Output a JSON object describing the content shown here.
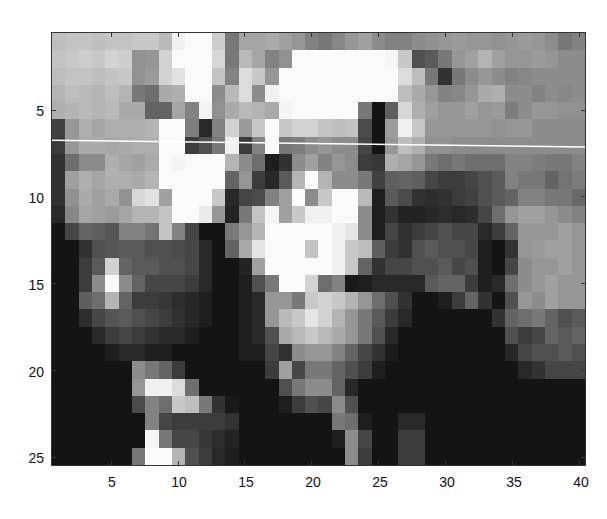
{
  "chart_data": {
    "type": "heatmap",
    "title": "",
    "xlabel": "",
    "ylabel": "",
    "colormap": "gray",
    "cols": 40,
    "rows": 25,
    "xlim": [
      0.5,
      40.5
    ],
    "ylim": [
      0.5,
      25.5
    ],
    "y_reversed": true,
    "xticks": [
      5,
      10,
      15,
      20,
      25,
      30,
      35,
      40
    ],
    "yticks": [
      5,
      10,
      15,
      20,
      25
    ],
    "xtick_labels": [
      "5",
      "10",
      "15",
      "20",
      "25",
      "30",
      "35",
      "40"
    ],
    "ytick_labels": [
      "5",
      "10",
      "15",
      "20",
      "25"
    ],
    "grid": false,
    "annotation_line": {
      "color": "#ffffff",
      "x0": 0.5,
      "y0": 6.7,
      "x1": 40.5,
      "y1": 7.1
    },
    "values": [
      [
        190,
        195,
        195,
        190,
        195,
        195,
        200,
        200,
        185,
        240,
        250,
        250,
        205,
        120,
        165,
        165,
        170,
        160,
        150,
        130,
        120,
        135,
        150,
        160,
        140,
        130,
        130,
        140,
        145,
        150,
        155,
        150,
        150,
        145,
        150,
        155,
        150,
        140,
        120,
        130
      ],
      [
        195,
        200,
        205,
        200,
        210,
        205,
        145,
        150,
        210,
        250,
        250,
        250,
        215,
        120,
        185,
        165,
        130,
        145,
        250,
        250,
        250,
        250,
        250,
        250,
        250,
        245,
        200,
        80,
        90,
        120,
        150,
        160,
        180,
        160,
        150,
        150,
        155,
        150,
        140,
        140
      ],
      [
        190,
        195,
        195,
        190,
        195,
        200,
        145,
        155,
        210,
        225,
        250,
        250,
        195,
        130,
        220,
        200,
        150,
        250,
        250,
        250,
        250,
        250,
        250,
        250,
        250,
        250,
        220,
        190,
        120,
        50,
        120,
        140,
        150,
        140,
        130,
        135,
        140,
        140,
        140,
        140
      ],
      [
        180,
        190,
        185,
        180,
        190,
        180,
        120,
        110,
        170,
        175,
        250,
        250,
        140,
        185,
        220,
        140,
        240,
        250,
        250,
        250,
        250,
        250,
        250,
        250,
        250,
        250,
        190,
        170,
        150,
        130,
        135,
        150,
        170,
        175,
        140,
        140,
        130,
        140,
        135,
        140
      ],
      [
        175,
        180,
        185,
        180,
        185,
        170,
        170,
        100,
        100,
        165,
        130,
        245,
        145,
        170,
        185,
        180,
        170,
        245,
        250,
        250,
        250,
        250,
        250,
        120,
        20,
        95,
        215,
        175,
        160,
        150,
        150,
        160,
        150,
        155,
        125,
        140,
        150,
        150,
        145,
        145
      ],
      [
        65,
        150,
        175,
        165,
        175,
        175,
        175,
        180,
        250,
        250,
        125,
        40,
        130,
        210,
        155,
        200,
        250,
        200,
        210,
        210,
        195,
        190,
        195,
        75,
        20,
        155,
        240,
        200,
        150,
        150,
        150,
        150,
        150,
        145,
        150,
        150,
        140,
        140,
        140,
        140
      ],
      [
        60,
        150,
        170,
        170,
        165,
        170,
        175,
        175,
        250,
        250,
        60,
        80,
        120,
        240,
        60,
        130,
        250,
        120,
        125,
        140,
        150,
        140,
        140,
        70,
        20,
        150,
        190,
        175,
        145,
        145,
        140,
        140,
        140,
        140,
        140,
        140,
        140,
        140,
        140,
        140
      ],
      [
        50,
        110,
        140,
        140,
        175,
        165,
        160,
        170,
        250,
        245,
        250,
        250,
        250,
        180,
        140,
        110,
        30,
        50,
        140,
        160,
        130,
        150,
        140,
        60,
        55,
        175,
        165,
        150,
        120,
        110,
        120,
        110,
        110,
        110,
        130,
        130,
        125,
        120,
        120,
        130
      ],
      [
        50,
        160,
        175,
        165,
        175,
        175,
        170,
        180,
        250,
        250,
        250,
        250,
        250,
        100,
        150,
        60,
        40,
        90,
        180,
        250,
        180,
        140,
        140,
        120,
        65,
        95,
        100,
        95,
        70,
        60,
        60,
        70,
        80,
        90,
        130,
        120,
        120,
        100,
        115,
        125
      ],
      [
        50,
        145,
        170,
        160,
        170,
        145,
        215,
        225,
        160,
        250,
        250,
        250,
        200,
        40,
        70,
        75,
        130,
        160,
        250,
        140,
        200,
        250,
        250,
        185,
        30,
        90,
        75,
        50,
        45,
        50,
        60,
        65,
        80,
        90,
        100,
        130,
        130,
        120,
        120,
        105
      ],
      [
        40,
        135,
        165,
        160,
        155,
        165,
        180,
        180,
        195,
        250,
        250,
        235,
        150,
        35,
        120,
        195,
        245,
        160,
        200,
        240,
        240,
        250,
        250,
        140,
        30,
        50,
        35,
        35,
        40,
        45,
        40,
        45,
        70,
        110,
        150,
        160,
        160,
        150,
        140,
        130
      ],
      [
        20,
        70,
        100,
        95,
        85,
        130,
        130,
        115,
        195,
        130,
        70,
        20,
        20,
        120,
        150,
        180,
        250,
        250,
        250,
        250,
        250,
        240,
        230,
        140,
        30,
        70,
        50,
        60,
        70,
        80,
        70,
        70,
        40,
        60,
        100,
        150,
        150,
        150,
        160,
        150
      ],
      [
        20,
        20,
        50,
        80,
        85,
        90,
        90,
        80,
        80,
        75,
        70,
        40,
        20,
        100,
        170,
        230,
        250,
        250,
        250,
        195,
        250,
        240,
        200,
        190,
        95,
        60,
        50,
        80,
        90,
        80,
        80,
        70,
        30,
        20,
        50,
        150,
        155,
        160,
        160,
        150
      ],
      [
        20,
        20,
        60,
        90,
        210,
        100,
        90,
        90,
        80,
        80,
        70,
        40,
        20,
        20,
        35,
        160,
        250,
        250,
        250,
        250,
        250,
        240,
        200,
        100,
        50,
        70,
        70,
        80,
        80,
        90,
        70,
        80,
        30,
        20,
        70,
        140,
        150,
        150,
        160,
        150
      ],
      [
        20,
        20,
        60,
        140,
        250,
        140,
        100,
        70,
        70,
        70,
        60,
        40,
        20,
        20,
        30,
        80,
        120,
        250,
        250,
        210,
        110,
        130,
        25,
        30,
        40,
        40,
        40,
        40,
        90,
        100,
        100,
        60,
        30,
        40,
        110,
        140,
        150,
        160,
        150,
        150
      ],
      [
        20,
        20,
        95,
        110,
        180,
        100,
        60,
        60,
        55,
        45,
        40,
        30,
        20,
        20,
        30,
        40,
        150,
        150,
        120,
        200,
        210,
        200,
        180,
        150,
        110,
        80,
        50,
        20,
        20,
        30,
        60,
        100,
        50,
        20,
        80,
        150,
        140,
        160,
        150,
        150
      ],
      [
        20,
        20,
        45,
        70,
        85,
        90,
        80,
        70,
        60,
        50,
        40,
        30,
        20,
        20,
        30,
        40,
        150,
        185,
        200,
        230,
        210,
        180,
        150,
        120,
        90,
        60,
        40,
        20,
        20,
        20,
        20,
        20,
        20,
        50,
        100,
        110,
        120,
        100,
        80,
        90
      ],
      [
        20,
        20,
        20,
        40,
        60,
        70,
        60,
        50,
        40,
        40,
        30,
        20,
        20,
        20,
        30,
        40,
        80,
        170,
        185,
        200,
        185,
        170,
        150,
        120,
        80,
        40,
        20,
        20,
        20,
        20,
        20,
        20,
        20,
        20,
        80,
        60,
        70,
        100,
        90,
        100
      ],
      [
        20,
        20,
        20,
        20,
        30,
        40,
        40,
        30,
        30,
        20,
        20,
        20,
        20,
        20,
        30,
        30,
        70,
        50,
        140,
        150,
        150,
        130,
        100,
        70,
        50,
        30,
        20,
        20,
        20,
        20,
        20,
        20,
        20,
        20,
        40,
        70,
        80,
        80,
        90,
        80
      ],
      [
        20,
        20,
        20,
        20,
        20,
        20,
        140,
        120,
        100,
        60,
        20,
        20,
        20,
        20,
        20,
        20,
        60,
        160,
        70,
        120,
        120,
        100,
        80,
        60,
        30,
        20,
        20,
        20,
        20,
        20,
        20,
        20,
        20,
        20,
        20,
        40,
        50,
        70,
        70,
        70
      ],
      [
        20,
        20,
        20,
        20,
        20,
        20,
        150,
        240,
        240,
        220,
        110,
        20,
        20,
        20,
        20,
        20,
        20,
        80,
        120,
        140,
        140,
        100,
        40,
        20,
        20,
        20,
        20,
        20,
        20,
        20,
        20,
        20,
        20,
        20,
        20,
        20,
        20,
        20,
        20,
        20
      ],
      [
        20,
        20,
        20,
        20,
        20,
        20,
        75,
        130,
        110,
        200,
        190,
        120,
        50,
        25,
        20,
        20,
        20,
        30,
        60,
        80,
        70,
        140,
        80,
        20,
        20,
        20,
        20,
        20,
        20,
        20,
        20,
        20,
        20,
        20,
        20,
        20,
        20,
        20,
        20,
        20
      ],
      [
        20,
        20,
        20,
        20,
        20,
        20,
        20,
        130,
        70,
        60,
        60,
        60,
        60,
        50,
        20,
        20,
        20,
        20,
        20,
        20,
        20,
        120,
        110,
        30,
        20,
        20,
        40,
        40,
        20,
        20,
        20,
        20,
        20,
        20,
        20,
        20,
        20,
        20,
        20,
        20
      ],
      [
        20,
        20,
        20,
        20,
        20,
        20,
        20,
        245,
        120,
        70,
        70,
        55,
        45,
        35,
        20,
        20,
        20,
        20,
        20,
        20,
        20,
        30,
        140,
        70,
        20,
        20,
        60,
        60,
        20,
        20,
        20,
        20,
        20,
        20,
        20,
        20,
        20,
        20,
        20,
        20
      ],
      [
        20,
        20,
        20,
        20,
        20,
        20,
        120,
        250,
        250,
        180,
        80,
        60,
        40,
        30,
        20,
        20,
        20,
        20,
        20,
        20,
        20,
        20,
        140,
        60,
        20,
        20,
        60,
        60,
        20,
        20,
        20,
        20,
        20,
        20,
        20,
        20,
        20,
        20,
        20,
        20
      ]
    ]
  },
  "axes": {
    "xtick_labels": [
      "5",
      "10",
      "15",
      "20",
      "25",
      "30",
      "35",
      "40"
    ],
    "ytick_labels": [
      "5",
      "10",
      "15",
      "20",
      "25"
    ]
  }
}
